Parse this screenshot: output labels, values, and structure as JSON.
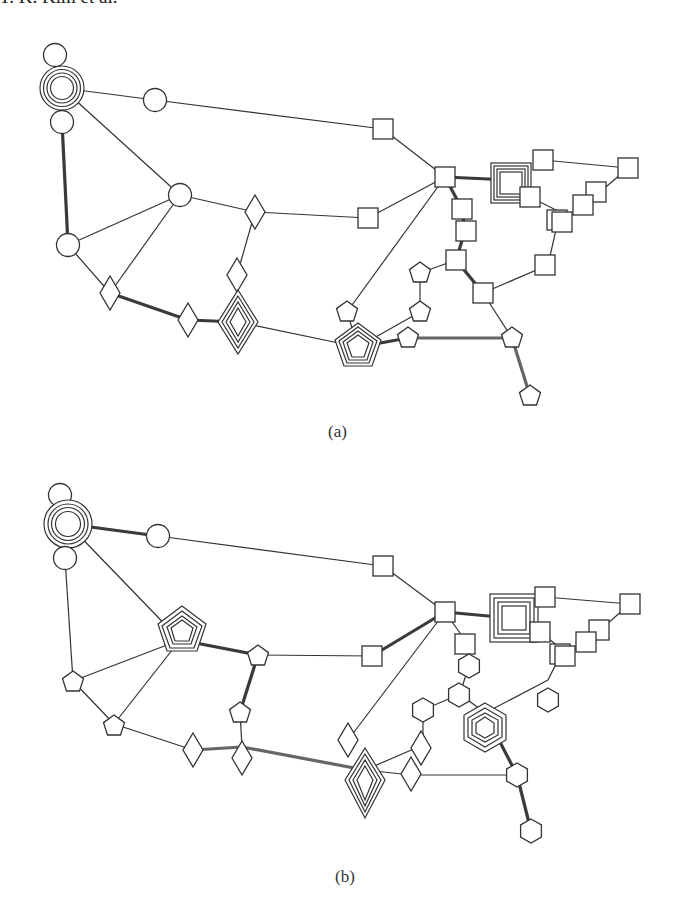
{
  "header": {
    "running_head": "Y. K. Kim et al."
  },
  "figure": {
    "panels": [
      {
        "id": "a",
        "caption": "(a)"
      },
      {
        "id": "b",
        "caption": "(b)"
      }
    ],
    "node_shapes": [
      "circle",
      "diamond",
      "square",
      "pentagon",
      "hexagon"
    ],
    "colors": {
      "stroke": "#333333",
      "thick_edge": "#3a3a3a",
      "fill": "#ffffff"
    }
  }
}
